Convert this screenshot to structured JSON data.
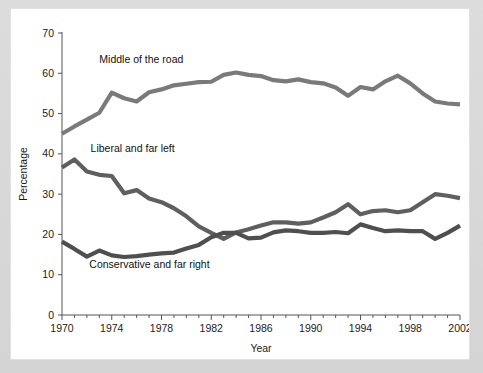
{
  "chart_data": {
    "type": "line",
    "title": "",
    "xlabel": "Year",
    "ylabel": "Percentage",
    "xlim": [
      1970,
      2002
    ],
    "ylim": [
      0,
      70
    ],
    "ytick_step": 10,
    "xtick_major_step": 4,
    "xtick_minor_step": 1,
    "grid": false,
    "legend_position": "inline-annotations",
    "x": [
      1970,
      1971,
      1972,
      1973,
      1974,
      1975,
      1976,
      1977,
      1978,
      1979,
      1980,
      1981,
      1982,
      1983,
      1984,
      1985,
      1986,
      1987,
      1988,
      1989,
      1990,
      1991,
      1992,
      1993,
      1994,
      1995,
      1996,
      1997,
      1998,
      1999,
      2000,
      2001,
      2002
    ],
    "xtick_labels": [
      "1970",
      "1974",
      "1978",
      "1982",
      "1986",
      "1990",
      "1994",
      "1998",
      "2002"
    ],
    "ytick_labels": [
      "0",
      "10",
      "20",
      "30",
      "40",
      "50",
      "60",
      "70"
    ],
    "series": [
      {
        "name": "Middle of the road",
        "color": "#7a7a7a",
        "stroke_width": 4.2,
        "label_x": 1973.0,
        "label_y": 62.5,
        "values": [
          45.0,
          46.8,
          48.5,
          50.2,
          55.2,
          53.8,
          53.0,
          55.3,
          56.0,
          57.0,
          57.4,
          57.8,
          57.9,
          59.6,
          60.2,
          59.6,
          59.3,
          58.3,
          58.0,
          58.5,
          57.8,
          57.5,
          56.5,
          54.4,
          56.6,
          56.0,
          58.0,
          59.4,
          57.5,
          55.0,
          53.0,
          52.5,
          52.3
        ]
      },
      {
        "name": "Liberal and far left",
        "color": "#5f5f5f",
        "stroke_width": 4.2,
        "label_x": 1972.3,
        "label_y": 40.5,
        "values": [
          36.6,
          38.6,
          35.6,
          34.8,
          34.5,
          30.2,
          31.0,
          28.9,
          28.0,
          26.5,
          24.5,
          22.0,
          20.4,
          18.9,
          20.5,
          21.3,
          22.2,
          23.0,
          23.0,
          22.7,
          23.0,
          24.2,
          25.5,
          27.5,
          25.0,
          25.8,
          26.0,
          25.5,
          26.0,
          28.0,
          30.0,
          29.6,
          29.0
        ]
      },
      {
        "name": "Conservative and far right",
        "color": "#4f4f4f",
        "stroke_width": 4.2,
        "label_x": 1972.2,
        "label_y": 11.7,
        "values": [
          18.2,
          16.4,
          14.5,
          16.0,
          14.8,
          14.4,
          14.6,
          15.0,
          15.3,
          15.5,
          16.5,
          17.4,
          19.3,
          20.4,
          20.4,
          19.0,
          19.2,
          20.5,
          21.0,
          20.8,
          20.4,
          20.4,
          20.6,
          20.3,
          22.5,
          21.6,
          20.8,
          21.0,
          20.8,
          20.8,
          18.9,
          20.4,
          22.2
        ]
      }
    ]
  }
}
